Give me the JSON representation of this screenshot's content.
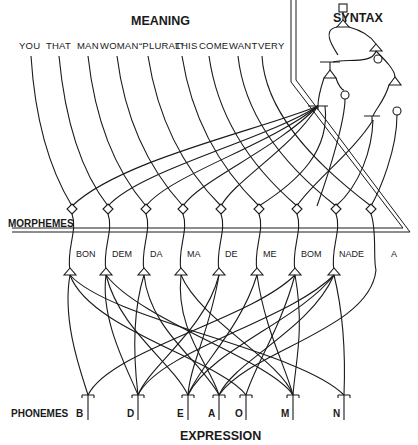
{
  "titles": {
    "meaning": "MEANING",
    "syntax": "SYNTAX",
    "morphemes": "MORPHEMES",
    "phonemes": "PHONEMES",
    "expression": "EXPRESSION"
  },
  "meaning_words": [
    "YOU",
    "THAT",
    "MAN",
    "WOMAN",
    "“PLURAL”",
    "THIS",
    "COME",
    "WANT",
    "VERY"
  ],
  "morphemes": [
    "BON",
    "DEM",
    "DA",
    "MA",
    "DE",
    "ME",
    "BOM",
    "NADE",
    "A"
  ],
  "phonemes": [
    "B",
    "D",
    "E",
    "A",
    "O",
    "M",
    "N"
  ],
  "colors": {
    "ink": "#1a1a1a",
    "background": "#ffffff"
  }
}
